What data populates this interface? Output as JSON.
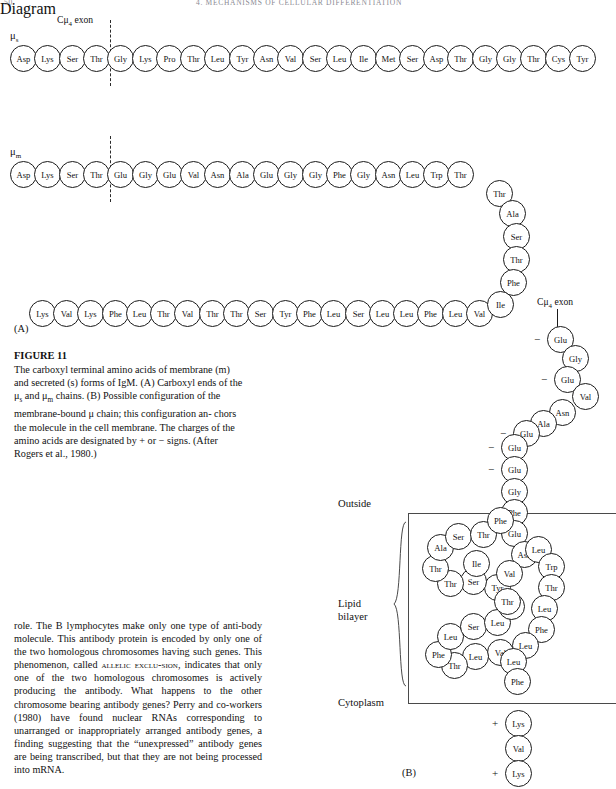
{
  "page": {
    "running_head_left": "50",
    "running_head_center": "4. MECHANISMS OF CELLULAR DIFFERENTIATION"
  },
  "figure": {
    "panel_a_label": "(A)",
    "panel_b_label": "(B)",
    "exon_label_top": "Cμ4 exon",
    "exon_label_right": "Cμ4 exon",
    "mu_s_label": "μs",
    "mu_m_label": "μm",
    "outside_label": "Outside",
    "lipid_bilayer_label_line1": "Lipid",
    "lipid_bilayer_label_line2": "bilayer",
    "cytoplasm_label": "Cytoplasm",
    "charge_plus": "+",
    "charge_minus": "−"
  },
  "chains": {
    "mu_s": {
      "name": "μs secreted chain",
      "residues": [
        "Asp",
        "Lys",
        "Ser",
        "Thr",
        "Gly",
        "Lys",
        "Pro",
        "Thr",
        "Leu",
        "Tyr",
        "Asn",
        "Val",
        "Ser",
        "Leu",
        "Ile",
        "Met",
        "Ser",
        "Asp",
        "Thr",
        "Gly",
        "Gly",
        "Thr",
        "Cys",
        "Tyr"
      ],
      "exon_boundary_after_index": 3
    },
    "mu_m": {
      "name": "μm membrane chain",
      "residues": [
        "Asp",
        "Lys",
        "Ser",
        "Thr",
        "Glu",
        "Gly",
        "Glu",
        "Val",
        "Asn",
        "Ala",
        "Glu",
        "Gly",
        "Gly",
        "Phe",
        "Gly",
        "Asn",
        "Leu",
        "Trp",
        "Thr"
      ],
      "exon_boundary_after_index": 3
    },
    "panel_b_horizontal": {
      "name": "panel B carboxyl horizontal run",
      "residues": [
        "Lys",
        "Val",
        "Lys",
        "Phe",
        "Leu",
        "Thr",
        "Val",
        "Thr",
        "Thr",
        "Ser",
        "Tyr",
        "Phe",
        "Leu",
        "Ser",
        "Leu",
        "Leu",
        "Phe",
        "Leu",
        "Val"
      ]
    },
    "panel_b_diagonal_down_left": {
      "name": "diagonal from Thr to Ile joining horizontal run",
      "residues": [
        "Thr",
        "Ala",
        "Ser",
        "Thr",
        "Phe",
        "Ile"
      ]
    },
    "panel_b_right_descending": {
      "name": "right descending extracellular segment",
      "residues": [
        "Glu",
        "Gly",
        "Glu",
        "Val",
        "Asn",
        "Ala",
        "Glu",
        "Glu",
        "Glu",
        "Gly",
        "Phe",
        "Glu",
        "Asn"
      ],
      "charges": {
        "0": "−",
        "2": "−",
        "6": "−",
        "7": "−",
        "8": "−",
        "11": "−"
      }
    },
    "panel_b_transmembrane": {
      "name": "transmembrane serpentine segment",
      "residues": [
        "Leu",
        "Trp",
        "Thr",
        "Leu",
        "Phe",
        "Leu",
        "Val",
        "Leu",
        "Thr",
        "Phe",
        "Leu",
        "Ser",
        "Leu",
        "Phe",
        "Tyr",
        "Ser",
        "Thr",
        "Thr",
        "Ala",
        "Ser",
        "Thr",
        "Phe",
        "Ile",
        "Val",
        "Thr",
        "Leu",
        "Phe"
      ]
    },
    "panel_b_cytoplasmic": {
      "name": "cytoplasmic tail",
      "residues": [
        "Lys",
        "Val",
        "Lys"
      ],
      "charges": {
        "0": "+",
        "2": "+"
      }
    }
  },
  "caption": {
    "figure_number": "FIGURE 11",
    "line1": "The carboxyl terminal amino acids of membrane (m)",
    "line2": "and secreted (s) forms of IgM. (A) Carboxyl ends of",
    "line3_pre": "the ",
    "line3_mus": "μs",
    "line3_mid": " and ",
    "line3_mum": "μm",
    "line3_post": " chains. (B) Possible configuration of",
    "line4": "the membrane-bound μ chain; this configuration an-",
    "line5": "chors the molecule in the cell membrane. The",
    "line6": "charges of the amino acids are designated by + or −",
    "line7": "signs. (After Rogers et al., 1980.)"
  },
  "body_text": {
    "part1": "role. The B lymphocytes make only one type of anti-body molecule. This antibody protein is encoded by only one of the two homologous chromosomes having such genes. This phenomenon, called ",
    "small_caps1": "allelic exclu-",
    "small_caps2": "sion",
    "part2": ", indicates that only one of the two homologous chromosomes is actively producing the antibody. What happens to the other chromosome bearing antibody genes? Perry and co-workers (1980) have found nuclear RNAs corresponding to unarranged or inappropriately arranged antibody genes, a finding suggesting that the “unexpressed” antibody genes are being transcribed, but that they are not being processed into mRNA."
  }
}
